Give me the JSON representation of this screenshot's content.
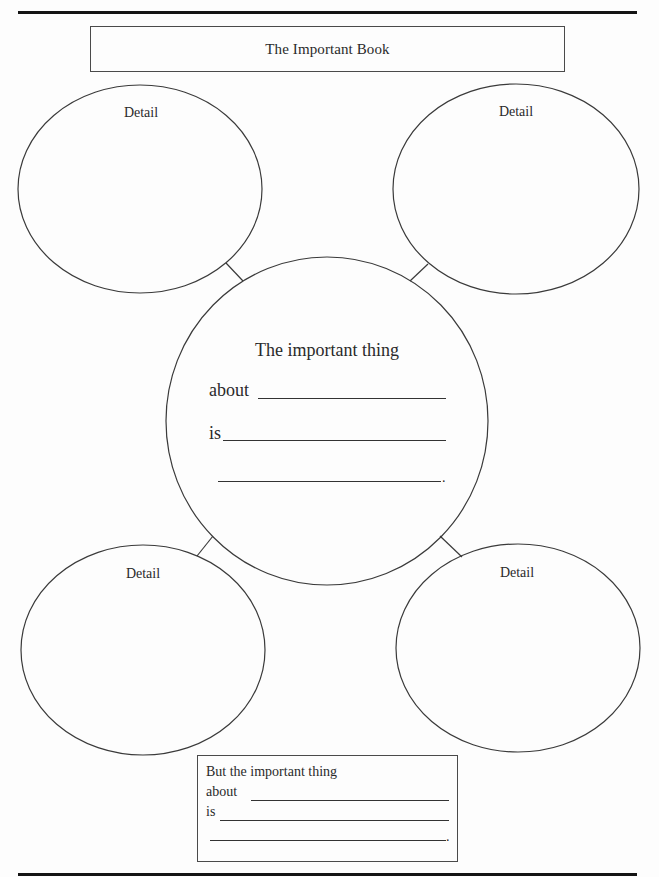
{
  "worksheet": {
    "title": "The Important Book",
    "details": [
      {
        "position": "top-left",
        "label": "Detail"
      },
      {
        "position": "top-right",
        "label": "Detail"
      },
      {
        "position": "bottom-left",
        "label": "Detail"
      },
      {
        "position": "bottom-right",
        "label": "Detail"
      }
    ],
    "center": {
      "heading": "The important thing",
      "line1_label": "about",
      "line2_label": "is",
      "line3_end": "."
    },
    "summary_box": {
      "heading": "But the important thing",
      "line1_label": "about",
      "line2_label": "is",
      "line3_end": "."
    }
  },
  "colors": {
    "ink": "#2a2a2a",
    "rule": "#141414",
    "paper": "#fdfdfd"
  }
}
